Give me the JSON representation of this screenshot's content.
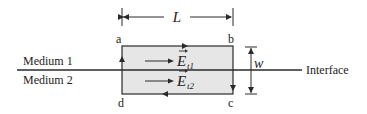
{
  "diagram": {
    "colors": {
      "line": "#2a2a2a",
      "rect_fill": "#e6e6e6",
      "text": "#222222"
    },
    "dimensions": {
      "length_label": "L",
      "width_label": "w"
    },
    "corners": {
      "a": "a",
      "b": "b",
      "c": "c",
      "d": "d"
    },
    "media": {
      "top": "Medium 1",
      "bottom": "Medium 2"
    },
    "interface_label": "Interface",
    "fields": {
      "upper": {
        "symbol": "E",
        "subscript": "t1"
      },
      "lower": {
        "symbol": "E",
        "subscript": "t2"
      }
    },
    "path_direction": "a → b → c → d → a (clockwise)"
  }
}
